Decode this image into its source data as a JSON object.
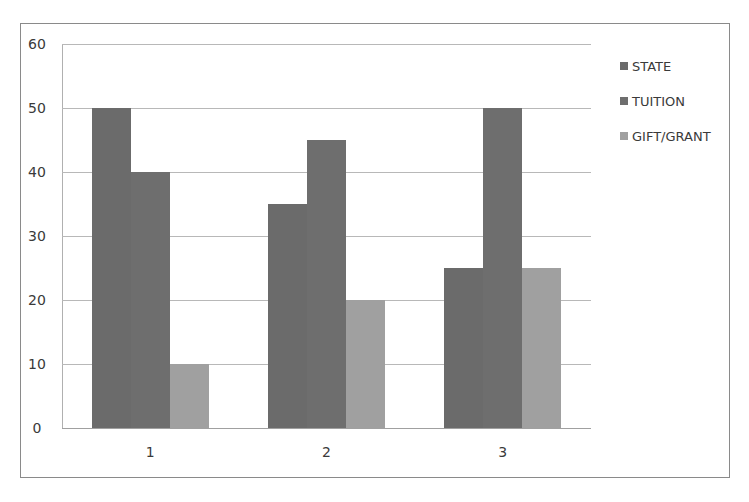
{
  "chart_data": {
    "type": "bar",
    "title": "",
    "xlabel": "",
    "ylabel": "",
    "categories": [
      "1",
      "2",
      "3"
    ],
    "series": [
      {
        "name": "STATE",
        "values": [
          50,
          35,
          25
        ],
        "color": "#6b6b6b"
      },
      {
        "name": "TUITION",
        "values": [
          40,
          45,
          50
        ],
        "color": "#6e6e6e"
      },
      {
        "name": "GIFT/GRANT",
        "values": [
          10,
          20,
          25
        ],
        "color": "#a0a0a0"
      }
    ],
    "ylim": [
      0,
      60
    ],
    "yticks": [
      "0",
      "10",
      "20",
      "30",
      "40",
      "50",
      "60"
    ],
    "grid": true,
    "legend_position": "right"
  }
}
